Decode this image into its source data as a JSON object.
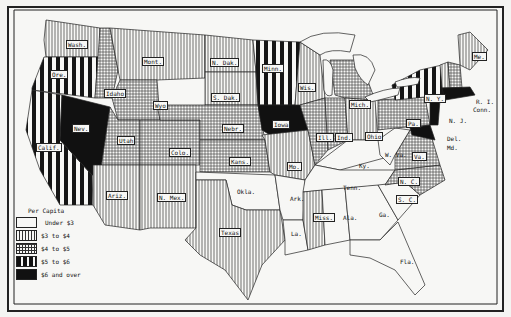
{
  "map": {
    "title": "",
    "legend": {
      "title": "Per Capita",
      "items": [
        {
          "label": "Under $3",
          "pattern": "blank",
          "fill": "#f7f7f5"
        },
        {
          "label": "$3 to $4",
          "pattern": "vertical-thin",
          "fill": "#d8d8d8"
        },
        {
          "label": "$4 to $5",
          "pattern": "grid",
          "fill": "#cfcfcf"
        },
        {
          "label": "$5 to $6",
          "pattern": "vertical-thick",
          "fill": "#555555"
        },
        {
          "label": "$6 and over",
          "pattern": "solid",
          "fill": "#111111"
        }
      ]
    },
    "states": {
      "wash": "Wash.",
      "ore": "Ore.",
      "calif": "Calif.",
      "nev": "Nev.",
      "idaho": "Idaho",
      "mont": "Mont.",
      "wyo": "Wyo",
      "utah": "Utah",
      "colo": "Colo.",
      "ariz": "Ariz.",
      "nmex": "N. Mex.",
      "ndak": "N. Dak.",
      "sdak": "S. Dak.",
      "nebr": "Nebr.",
      "kans": "Kans.",
      "okla": "Okla.",
      "texas": "Texas",
      "minn": "Minn.",
      "iowa": "Iowa",
      "mo": "Mo.",
      "ark": "Ark.",
      "la": "La.",
      "wis": "Wis.",
      "ill": "Ill.",
      "ind": "Ind.",
      "mich": "Mich.",
      "ohio": "Ohio",
      "ky": "Ky.",
      "tenn": "Tenn.",
      "miss": "Miss.",
      "ala": "Ala.",
      "ga": "Ga.",
      "fla": "Fla.",
      "sc": "S. C.",
      "nc": "N. C.",
      "va": "Va.",
      "wva": "W. Va.",
      "pa": "Pa.",
      "ny": "N. Y.",
      "nj": "N. J.",
      "del": "Del.",
      "md": "Md.",
      "me": "Me.",
      "vt": "Vt.",
      "nh": "N. H.",
      "mass": "Mass.",
      "ri": "R. I.",
      "conn": "Conn."
    },
    "categories_by_state": {
      "Under $3": [
        "Okla.",
        "Ark.",
        "La.",
        "Ala.",
        "Ga.",
        "Fla.",
        "Tenn.",
        "Ky.",
        "W. Va.",
        "S. C."
      ],
      "$3 to $4": [
        "Wash.",
        "Mont.",
        "N. Dak.",
        "S. Dak.",
        "Ariz.",
        "N. Mex.",
        "Texas",
        "Mo.",
        "Wis.",
        "Ohio",
        "Miss.",
        "Me.",
        "Vt."
      ],
      "$4 to $5": [
        "Idaho",
        "Wyo",
        "Utah",
        "Colo.",
        "Nebr.",
        "Kans.",
        "Ill.",
        "Ind.",
        "Mich.",
        "Pa.",
        "Va.",
        "N. C.",
        "N. H."
      ],
      "$5 to $6": [
        "Ore.",
        "Calif.",
        "Minn.",
        "N. Y."
      ],
      "$6 and over": [
        "Nev.",
        "Iowa",
        "Mass.",
        "R. I.",
        "Conn.",
        "N. J.",
        "Del.",
        "Md."
      ]
    }
  }
}
